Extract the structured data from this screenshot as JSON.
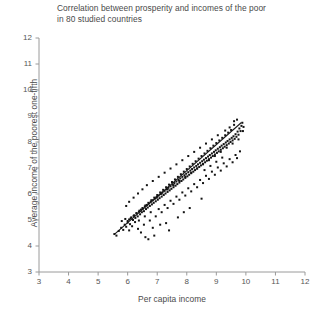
{
  "chart_data": {
    "type": "scatter",
    "title": "Correlation between prosperity and incomes of the poor\nin 80 studied countries",
    "xlabel": "Per capita income",
    "ylabel": "Average income of the poorest one-fifth",
    "xlim": [
      3,
      12
    ],
    "ylim": [
      3,
      12
    ],
    "xticks": [
      3,
      4,
      5,
      6,
      7,
      8,
      9,
      10,
      11,
      12
    ],
    "yticks": [
      3,
      4,
      5,
      6,
      7,
      8,
      9,
      10,
      11,
      12
    ],
    "xticklabels": [
      "3",
      "4",
      "5",
      "6",
      "7",
      "8",
      "9",
      "10",
      "11",
      "12"
    ],
    "yticklabels": [
      "3",
      "4",
      "5",
      "6",
      "7",
      "8",
      "9",
      "10",
      "11",
      "12"
    ],
    "grid": false,
    "legend": "none",
    "marker": "square",
    "marker_size": 2,
    "marker_color": "#141414",
    "axis_color": "#9a9a9a",
    "background_color": "#ffffff",
    "trendline": {
      "label": "fitted regression line",
      "color": "#1a1a1a",
      "x_start": 5.55,
      "y_start": 4.45,
      "x_end": 9.85,
      "y_end": 8.75,
      "slope": 1.0,
      "intercept": -1.1
    },
    "series": [
      {
        "name": "countries",
        "points": [
          [
            5.55,
            4.46
          ],
          [
            5.62,
            4.4
          ],
          [
            5.7,
            4.58
          ],
          [
            5.78,
            4.7
          ],
          [
            5.85,
            4.62
          ],
          [
            5.9,
            4.82
          ],
          [
            5.95,
            4.74
          ],
          [
            6.0,
            4.9
          ],
          [
            6.05,
            5.02
          ],
          [
            6.08,
            4.84
          ],
          [
            6.12,
            5.1
          ],
          [
            6.18,
            5.0
          ],
          [
            6.22,
            5.18
          ],
          [
            6.26,
            5.08
          ],
          [
            6.3,
            5.26
          ],
          [
            6.34,
            5.14
          ],
          [
            6.38,
            5.32
          ],
          [
            6.42,
            5.22
          ],
          [
            6.45,
            5.4
          ],
          [
            6.48,
            5.3
          ],
          [
            6.52,
            5.44
          ],
          [
            6.55,
            5.34
          ],
          [
            6.58,
            5.52
          ],
          [
            6.62,
            5.42
          ],
          [
            6.65,
            5.58
          ],
          [
            6.68,
            5.48
          ],
          [
            6.72,
            5.64
          ],
          [
            6.75,
            5.54
          ],
          [
            6.78,
            5.7
          ],
          [
            6.82,
            5.6
          ],
          [
            6.85,
            5.76
          ],
          [
            6.88,
            5.66
          ],
          [
            6.92,
            5.82
          ],
          [
            6.95,
            5.72
          ],
          [
            6.98,
            5.88
          ],
          [
            7.02,
            5.78
          ],
          [
            7.05,
            5.94
          ],
          [
            7.08,
            5.84
          ],
          [
            7.12,
            6.0
          ],
          [
            7.15,
            5.9
          ],
          [
            7.18,
            6.06
          ],
          [
            7.22,
            5.96
          ],
          [
            7.25,
            6.12
          ],
          [
            7.28,
            6.02
          ],
          [
            7.32,
            6.18
          ],
          [
            7.35,
            6.08
          ],
          [
            7.38,
            6.24
          ],
          [
            7.42,
            6.14
          ],
          [
            7.45,
            6.3
          ],
          [
            7.48,
            6.2
          ],
          [
            7.52,
            6.36
          ],
          [
            7.55,
            6.26
          ],
          [
            7.58,
            6.42
          ],
          [
            7.62,
            6.32
          ],
          [
            7.65,
            6.48
          ],
          [
            7.68,
            6.38
          ],
          [
            7.72,
            6.54
          ],
          [
            7.75,
            6.44
          ],
          [
            7.78,
            6.6
          ],
          [
            7.82,
            6.5
          ],
          [
            7.85,
            6.66
          ],
          [
            7.88,
            6.56
          ],
          [
            7.92,
            6.72
          ],
          [
            7.95,
            6.62
          ],
          [
            7.98,
            6.78
          ],
          [
            8.02,
            6.68
          ],
          [
            8.05,
            6.84
          ],
          [
            8.08,
            6.74
          ],
          [
            8.12,
            6.9
          ],
          [
            8.15,
            6.8
          ],
          [
            8.18,
            6.96
          ],
          [
            8.22,
            6.86
          ],
          [
            8.25,
            7.02
          ],
          [
            8.28,
            6.92
          ],
          [
            8.32,
            7.08
          ],
          [
            8.35,
            6.98
          ],
          [
            8.38,
            7.14
          ],
          [
            8.42,
            7.04
          ],
          [
            8.45,
            7.2
          ],
          [
            8.48,
            7.1
          ],
          [
            8.52,
            7.26
          ],
          [
            8.55,
            7.16
          ],
          [
            8.58,
            7.32
          ],
          [
            8.62,
            7.22
          ],
          [
            8.65,
            7.38
          ],
          [
            8.68,
            7.28
          ],
          [
            8.72,
            7.44
          ],
          [
            8.75,
            7.34
          ],
          [
            8.78,
            7.5
          ],
          [
            8.82,
            7.4
          ],
          [
            8.85,
            7.56
          ],
          [
            8.88,
            7.46
          ],
          [
            8.92,
            7.62
          ],
          [
            8.95,
            7.52
          ],
          [
            8.98,
            7.68
          ],
          [
            9.02,
            7.58
          ],
          [
            9.05,
            7.74
          ],
          [
            9.08,
            7.64
          ],
          [
            9.12,
            7.8
          ],
          [
            9.15,
            7.7
          ],
          [
            9.18,
            7.86
          ],
          [
            9.22,
            7.76
          ],
          [
            9.25,
            7.92
          ],
          [
            9.28,
            7.82
          ],
          [
            9.32,
            7.98
          ],
          [
            9.35,
            7.88
          ],
          [
            9.38,
            8.04
          ],
          [
            9.42,
            7.94
          ],
          [
            9.45,
            8.1
          ],
          [
            9.48,
            8.0
          ],
          [
            9.52,
            8.16
          ],
          [
            9.55,
            8.06
          ],
          [
            9.58,
            8.22
          ],
          [
            9.62,
            8.12
          ],
          [
            9.65,
            8.3
          ],
          [
            9.68,
            8.2
          ],
          [
            9.72,
            8.4
          ],
          [
            9.75,
            8.28
          ],
          [
            9.78,
            8.52
          ],
          [
            9.82,
            8.42
          ],
          [
            9.85,
            8.62
          ],
          [
            9.88,
            8.74
          ],
          [
            9.7,
            8.86
          ],
          [
            9.6,
            8.66
          ],
          [
            9.5,
            8.46
          ],
          [
            9.4,
            8.36
          ],
          [
            9.3,
            8.26
          ],
          [
            9.2,
            8.16
          ],
          [
            9.1,
            8.06
          ],
          [
            9.0,
            7.96
          ],
          [
            8.9,
            7.86
          ],
          [
            8.8,
            7.76
          ],
          [
            8.7,
            7.66
          ],
          [
            8.6,
            7.56
          ],
          [
            8.5,
            7.46
          ],
          [
            8.4,
            7.36
          ],
          [
            8.3,
            7.26
          ],
          [
            8.2,
            7.16
          ],
          [
            8.1,
            7.06
          ],
          [
            8.0,
            6.96
          ],
          [
            7.9,
            6.86
          ],
          [
            7.8,
            6.76
          ],
          [
            7.7,
            6.66
          ],
          [
            7.6,
            6.56
          ],
          [
            7.5,
            6.46
          ],
          [
            7.4,
            6.36
          ],
          [
            7.3,
            6.26
          ],
          [
            7.2,
            6.16
          ],
          [
            7.1,
            6.06
          ],
          [
            7.0,
            5.96
          ],
          [
            6.9,
            5.86
          ],
          [
            6.8,
            5.76
          ],
          [
            6.7,
            5.66
          ],
          [
            6.6,
            5.56
          ],
          [
            6.5,
            5.46
          ],
          [
            6.4,
            5.36
          ],
          [
            6.3,
            5.26
          ],
          [
            6.2,
            5.16
          ],
          [
            6.1,
            5.06
          ],
          [
            6.0,
            4.96
          ],
          [
            7.05,
            5.42
          ],
          [
            7.25,
            5.58
          ],
          [
            7.45,
            5.74
          ],
          [
            7.65,
            5.9
          ],
          [
            7.85,
            6.06
          ],
          [
            8.05,
            6.22
          ],
          [
            8.25,
            6.38
          ],
          [
            8.45,
            6.54
          ],
          [
            8.65,
            6.7
          ],
          [
            8.85,
            6.86
          ],
          [
            9.05,
            7.02
          ],
          [
            9.25,
            7.18
          ],
          [
            9.45,
            7.34
          ],
          [
            9.65,
            7.5
          ],
          [
            9.8,
            7.64
          ],
          [
            7.15,
            5.3
          ],
          [
            7.55,
            5.62
          ],
          [
            7.95,
            5.94
          ],
          [
            8.35,
            6.26
          ],
          [
            8.75,
            6.58
          ],
          [
            9.15,
            6.9
          ],
          [
            9.55,
            7.22
          ],
          [
            6.95,
            5.14
          ],
          [
            6.75,
            4.98
          ],
          [
            6.55,
            4.82
          ],
          [
            6.35,
            4.66
          ],
          [
            7.35,
            5.46
          ],
          [
            7.75,
            5.78
          ],
          [
            8.15,
            6.1
          ],
          [
            8.55,
            6.42
          ],
          [
            8.95,
            6.74
          ],
          [
            9.35,
            7.06
          ],
          [
            9.7,
            7.38
          ],
          [
            6.85,
            4.7
          ],
          [
            7.1,
            4.82
          ],
          [
            7.4,
            4.6
          ],
          [
            6.9,
            4.4
          ],
          [
            6.6,
            4.34
          ],
          [
            7.7,
            5.1
          ],
          [
            8.1,
            5.46
          ],
          [
            8.5,
            5.82
          ],
          [
            6.45,
            4.52
          ],
          [
            6.7,
            4.26
          ],
          [
            7.3,
            4.88
          ],
          [
            7.9,
            5.3
          ],
          [
            6.25,
            4.92
          ],
          [
            6.15,
            4.76
          ],
          [
            6.05,
            4.6
          ],
          [
            5.92,
            5.04
          ],
          [
            5.8,
            4.96
          ],
          [
            9.9,
            8.42
          ],
          [
            9.92,
            8.58
          ],
          [
            9.6,
            8.8
          ],
          [
            9.45,
            8.56
          ],
          [
            9.3,
            8.44
          ],
          [
            9.05,
            8.26
          ],
          [
            8.85,
            8.1
          ],
          [
            8.65,
            7.94
          ],
          [
            8.45,
            7.78
          ],
          [
            8.25,
            7.62
          ],
          [
            8.05,
            7.46
          ],
          [
            7.85,
            7.3
          ],
          [
            7.65,
            7.14
          ],
          [
            7.45,
            6.98
          ],
          [
            7.25,
            6.82
          ],
          [
            7.05,
            6.66
          ],
          [
            6.85,
            6.5
          ],
          [
            6.65,
            6.34
          ],
          [
            6.5,
            6.18
          ],
          [
            6.35,
            6.02
          ],
          [
            6.2,
            5.86
          ],
          [
            6.05,
            5.7
          ],
          [
            5.95,
            5.54
          ],
          [
            9.75,
            8.1
          ],
          [
            9.55,
            7.94
          ],
          [
            9.35,
            7.78
          ],
          [
            9.15,
            7.62
          ],
          [
            8.95,
            7.46
          ],
          [
            8.75,
            7.3
          ],
          [
            8.55,
            7.14
          ],
          [
            8.35,
            6.98
          ],
          [
            8.15,
            6.82
          ],
          [
            7.95,
            6.66
          ],
          [
            7.75,
            6.5
          ],
          [
            7.55,
            6.34
          ],
          [
            7.35,
            6.18
          ],
          [
            7.15,
            6.02
          ],
          [
            6.98,
            5.86
          ],
          [
            6.78,
            5.3
          ],
          [
            6.58,
            5.14
          ],
          [
            6.38,
            4.98
          ],
          [
            9.2,
            7.4
          ],
          [
            9.0,
            7.24
          ],
          [
            8.8,
            7.08
          ],
          [
            8.6,
            6.92
          ]
        ]
      }
    ]
  }
}
